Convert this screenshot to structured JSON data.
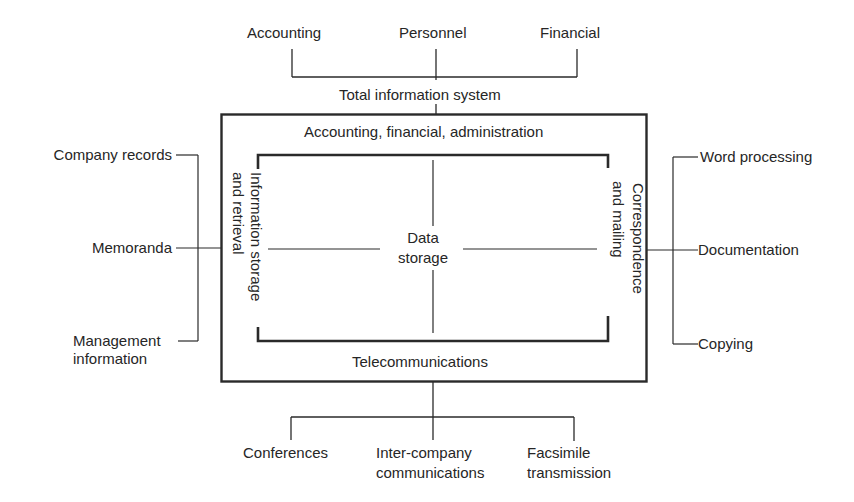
{
  "diagram": {
    "top_inputs": [
      "Accounting",
      "Personnel",
      "Financial"
    ],
    "system_title": "Total information system",
    "outer_box": {
      "top_label": "Accounting, financial, administration",
      "bottom_label": "Telecommunications",
      "left_label": [
        "Information storage",
        "and retrieval"
      ],
      "right_label": [
        "Correspondence",
        "and mailing"
      ]
    },
    "center": {
      "line1": "Data",
      "line2": "storage"
    },
    "left_inputs": [
      {
        "line1": "Company records"
      },
      {
        "line1": "Memoranda"
      },
      {
        "line1": "Management",
        "line2": "information"
      }
    ],
    "right_outputs": [
      "Word processing",
      "Documentation",
      "Copying"
    ],
    "bottom_outputs": [
      {
        "line1": "Conferences"
      },
      {
        "line1": "Inter-company",
        "line2": "communications"
      },
      {
        "line1": "Facsimile",
        "line2": "transmission"
      }
    ]
  }
}
